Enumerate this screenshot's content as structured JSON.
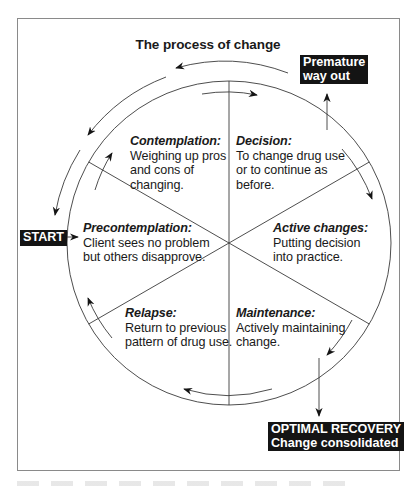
{
  "title": "The process of change",
  "stages": [
    {
      "id": "contemplation",
      "name": "Contemplation:",
      "desc": "Weighing up pros\nand cons of\nchanging."
    },
    {
      "id": "decision",
      "name": "Decision:",
      "desc": "To change drug use\nor to continue as\nbefore."
    },
    {
      "id": "precontemplation",
      "name": "Precontemplation:",
      "desc": "Client sees no problem\nbut others disapprove."
    },
    {
      "id": "active-changes",
      "name": "Active changes:",
      "desc": "Putting decision\ninto practice."
    },
    {
      "id": "relapse",
      "name": "Relapse:",
      "desc": "Return to previous\npattern of drug use."
    },
    {
      "id": "maintenance",
      "name": "Maintenance:",
      "desc": "Actively maintaining\nchange."
    }
  ],
  "badges": {
    "start": "START",
    "premature": "Premature\nway out",
    "optimal": "OPTIMAL RECOVERY\nChange consolidated"
  },
  "colors": {
    "line": "#3a3a3a",
    "badge_bg": "#141414",
    "badge_text": "#ffffff",
    "frame": "#8a8a8a"
  }
}
